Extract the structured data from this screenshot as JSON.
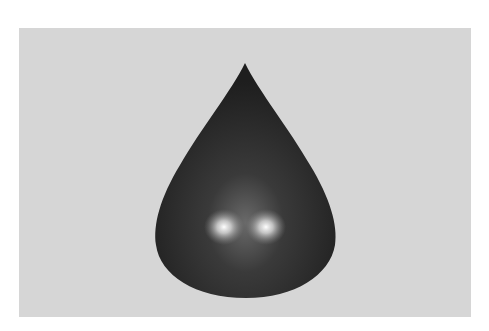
{
  "image": {
    "subject": "dark glossy liquid drop",
    "background_color": "#d6d6d6",
    "canvas_color": "#ffffff",
    "drop": {
      "body_color": "#2e2e2e",
      "edge_color": "#1a1a1a",
      "highlight_color": "#f2f2f2",
      "highlights": 2
    }
  }
}
